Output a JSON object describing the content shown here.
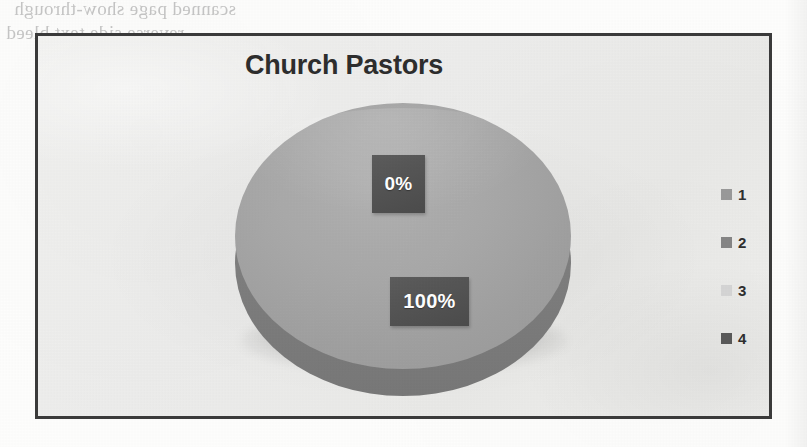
{
  "page": {
    "background_color": "#fdfdfc",
    "bleed_through_text": {
      "line1": "scanned page show-through",
      "line2": "reverse side text bleed",
      "line3": "margin note bleed"
    }
  },
  "chart_frame": {
    "border_color": "#3b3b3b",
    "plot_background_color": "#eeeeec"
  },
  "chart_data": {
    "type": "pie",
    "title": "Church Pastors",
    "xlabel": "",
    "ylabel": "",
    "three_d": true,
    "legend_position": "right",
    "grid": false,
    "categories": [
      "1",
      "2",
      "3",
      "4"
    ],
    "values": [
      100,
      0,
      0,
      0
    ],
    "data_labels": [
      "100%",
      "0%",
      "",
      ""
    ],
    "slice_colors": [
      "#a0a0a0",
      "#8a8a8a",
      "#d9d9d9",
      "#5a5a5a"
    ],
    "annotations": [
      {
        "text": "0%",
        "value": 0
      },
      {
        "text": "100%",
        "value": 100
      }
    ]
  },
  "legend": {
    "items": [
      {
        "label": "1",
        "color": "#9a9a9a"
      },
      {
        "label": "2",
        "color": "#868686"
      },
      {
        "label": "3",
        "color": "#d6d6d6"
      },
      {
        "label": "4",
        "color": "#5a5a5a"
      }
    ]
  },
  "labels": {
    "zero": "0%",
    "hundred": "100%"
  }
}
